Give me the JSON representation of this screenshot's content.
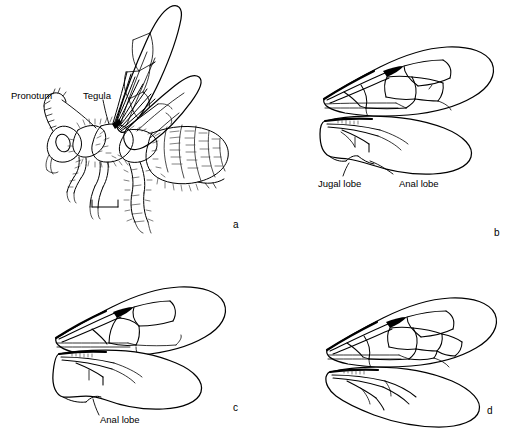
{
  "figure": {
    "name": "bee-morphology-plate",
    "background_color": "#ffffff",
    "ink_color": "#000000",
    "width": 523,
    "height": 431,
    "panel_count": 4
  },
  "panels": {
    "a": {
      "letter": "a",
      "subject": "lateral habitus of bee with raised wings",
      "labels": {
        "pronotum": "Pronotum",
        "tegula": "Tegula"
      },
      "scale_bar": {
        "present": true,
        "caption": ""
      }
    },
    "b": {
      "letter": "b",
      "subject": "fore and hind wing with jugal and anal lobes",
      "labels": {
        "jugal_lobe": "Jugal lobe",
        "anal_lobe": "Anal lobe"
      }
    },
    "c": {
      "letter": "c",
      "subject": "fore and hind wing with anal lobe",
      "labels": {
        "anal_lobe": "Anal lobe"
      }
    },
    "d": {
      "letter": "d",
      "subject": "fore and hind wing with complex venation",
      "labels": {}
    }
  }
}
